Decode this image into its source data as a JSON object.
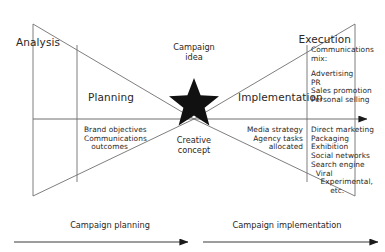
{
  "diagram": {
    "title_stages": {
      "analysis": "Analysis",
      "planning": "Planning",
      "implementation": "Implementation",
      "execution": "Execution"
    },
    "center": {
      "idea_label": "Campaign\nidea",
      "concept_label": "Creative\nconcept",
      "star_icon": "star-icon"
    },
    "planning_details": "Brand objectives\nCommunications\n   outcomes",
    "implementation_details": "Media strategy\nAgency tasks\nallocated",
    "execution_mix": {
      "heading": "Communications\nmix:",
      "items": "Advertising\nPR\nSales promotion\nPersonal selling"
    },
    "execution_channels": "Direct marketing\nPackaging\nExhibition\nSocial networks\nSearch engine\n  Viral\n    Experimental,\n        etc.",
    "bottom_axis": {
      "left_label": "Campaign planning",
      "right_label": "Campaign implementation",
      "left_arrow_icon": "arrow-right-icon",
      "right_arrow_icon": "arrow-right-icon"
    },
    "main_axis_arrow_icon": "arrow-right-icon",
    "colors": {
      "line": "#6f6f6f",
      "text": "#2b2724",
      "star": "#111111",
      "background": "#ffffff"
    }
  }
}
